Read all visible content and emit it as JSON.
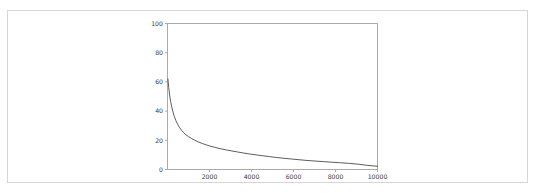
{
  "card": {
    "background": "#ffffff",
    "border_color": "#d6d6d6"
  },
  "chart_data": {
    "type": "line",
    "title": "",
    "subtitle": "",
    "xlabel": "",
    "ylabel": "",
    "xlim": [
      0,
      10000
    ],
    "ylim": [
      0,
      100
    ],
    "grid": false,
    "legend": null,
    "line_color": "#4a4a4a",
    "line_width": 0.9,
    "frame_color": "#aaaaaa",
    "xticks": [
      2000,
      4000,
      6000,
      8000,
      10000
    ],
    "xtick_labels": [
      "2000",
      "4000",
      "6000",
      "8000",
      "10000"
    ],
    "yticks": [
      0,
      20,
      40,
      60,
      80,
      100
    ],
    "ytick_labels": [
      "0",
      "20",
      "40",
      "60",
      "80",
      "100"
    ],
    "x": [
      20,
      60,
      100,
      150,
      200,
      260,
      320,
      400,
      480,
      560,
      660,
      760,
      880,
      1000,
      1150,
      1300,
      1480,
      1660,
      1860,
      2060,
      2300,
      2540,
      2800,
      3060,
      3340,
      3620,
      3920,
      4220,
      4540,
      4860,
      5200,
      5540,
      5900,
      6260,
      6640,
      7020,
      7420,
      7820,
      8240,
      8660,
      9100,
      9540,
      10000
    ],
    "y": [
      62,
      56,
      51,
      46.5,
      43,
      39.5,
      36.5,
      33.5,
      31,
      29,
      27,
      25.4,
      23.8,
      22.5,
      21.2,
      20,
      18.8,
      17.8,
      16.8,
      15.9,
      15,
      14.2,
      13.4,
      12.7,
      12,
      11.3,
      10.6,
      10,
      9.4,
      8.8,
      8.2,
      7.7,
      7.2,
      6.7,
      6.2,
      5.8,
      5.4,
      5.0,
      4.6,
      4.2,
      3.6,
      2.8,
      2.2
    ]
  }
}
